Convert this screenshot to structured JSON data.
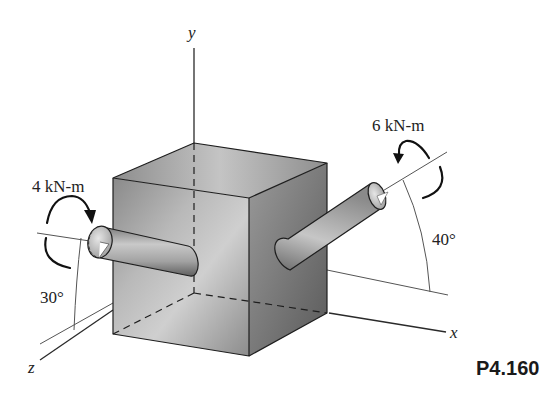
{
  "figure": {
    "label": "P4.160",
    "axes": {
      "x": "x",
      "y": "y",
      "z": "z"
    },
    "left_shaft": {
      "couple_label": "4 kN-m",
      "angle_label": "30°"
    },
    "right_shaft": {
      "couple_label": "6 kN-m",
      "angle_label": "40°"
    }
  },
  "colors": {
    "background": "#ffffff",
    "line": "#1e1e1e",
    "cube_light": "#d8d8d8",
    "cube_dark": "#6a6a6a"
  }
}
